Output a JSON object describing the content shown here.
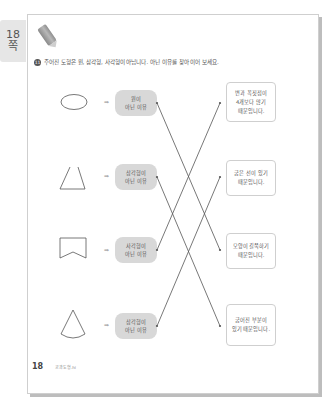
{
  "side_tab": {
    "page": "18",
    "unit": "쪽"
  },
  "question": {
    "number": "11",
    "text": "주어진 도형은 원, 삼각형, 사각형이 아닙니다. 아닌 이유를 찾아 이어 보세요."
  },
  "rows": [
    {
      "shape": "ellipse",
      "pill_line1": "원이",
      "pill_line2": "아닌 이유"
    },
    {
      "shape": "open-triangle",
      "pill_line1": "삼각형이",
      "pill_line2": "아닌 이유"
    },
    {
      "shape": "notched-rectangle",
      "pill_line1": "사각형이",
      "pill_line2": "아닌 이유"
    },
    {
      "shape": "cone",
      "pill_line1": "삼각형이",
      "pill_line2": "아닌 이유"
    }
  ],
  "answers": [
    {
      "line1": "변과 꼭짓점이",
      "line2": "4개보다 많기",
      "line3": "때문입니다."
    },
    {
      "line1": "굽은 선이 있기",
      "line2": "때문입니다."
    },
    {
      "line1": "모양이 길쭉하기",
      "line2": "때문입니다."
    },
    {
      "line1": "굽어진 부분이",
      "line2": "있기 때문입니다."
    }
  ],
  "connections": [
    {
      "from": 1,
      "to": 3
    },
    {
      "from": 2,
      "to": 4
    },
    {
      "from": 3,
      "to": 1
    },
    {
      "from": 4,
      "to": 2
    }
  ],
  "arrow_glyph": "➡",
  "footer": {
    "page_number": "18",
    "book": "교과도형.hi"
  },
  "colors": {
    "line": "#555555",
    "pill": "#d8d8d8",
    "tab": "#e6e6e6"
  }
}
